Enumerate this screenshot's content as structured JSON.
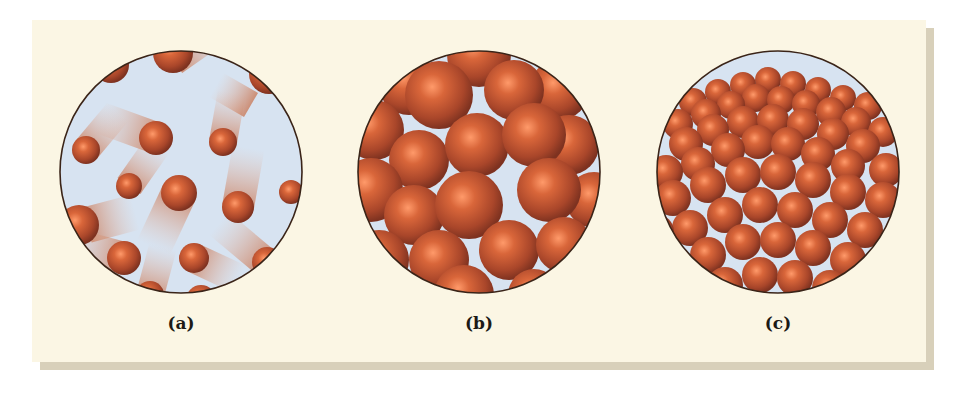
{
  "figure": {
    "background_color": "#fbf6e4",
    "shadow_color": "#d8d0ba",
    "sphere_color": "#b8502e",
    "sphere_highlight": "#ff9a6a",
    "void_color": "#d7e3f1",
    "outline_color": "#3a2418",
    "panels": [
      {
        "id": "a",
        "label": "(a)",
        "description": "gas: widely spaced particles with motion trails"
      },
      {
        "id": "b",
        "label": "(b)",
        "description": "liquid: closely packed, disordered particles"
      },
      {
        "id": "c",
        "label": "(c)",
        "description": "solid: closely packed, ordered lattice of particles"
      }
    ]
  }
}
